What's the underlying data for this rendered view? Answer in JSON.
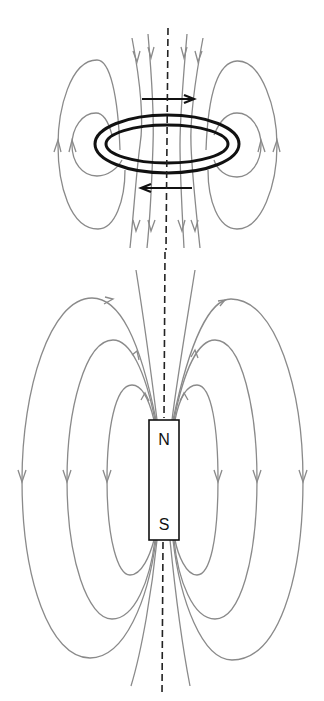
{
  "diagram": {
    "current_loop": {
      "description": "Current-carrying loop with field lines passing through its center",
      "current_direction_top": "right",
      "current_direction_bottom": "left"
    },
    "bar_magnet": {
      "north_label": "N",
      "south_label": "S"
    },
    "axis": "dashed vertical symmetry axis",
    "colors": {
      "field_lines": "#8a8a8a",
      "conductor": "#111111",
      "background": "#ffffff"
    }
  }
}
